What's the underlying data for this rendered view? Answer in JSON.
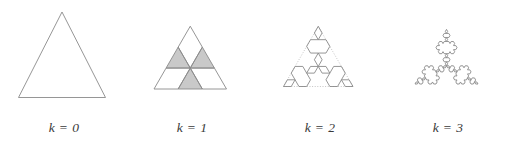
{
  "figure": {
    "type": "koch-snowflake-iterations",
    "background_color": "#ffffff",
    "stroke_color": "#8a8a8a",
    "guide_color": "#b6b6b6",
    "shade_color": "#c9c9c9",
    "panel_count": 4
  },
  "panels": [
    {
      "id": "k0",
      "caption": "k = 0",
      "iteration": 0,
      "segments": 3,
      "description": "equilateral triangle",
      "has_guide": false,
      "shaded_triangles": 0
    },
    {
      "id": "k1",
      "caption": "k = 1",
      "iteration": 1,
      "segments": 12,
      "description": "six-pointed star",
      "has_guide": false,
      "shaded_triangles": 3
    },
    {
      "id": "k2",
      "caption": "k = 2",
      "iteration": 2,
      "segments": 48,
      "description": "koch snowflake level 2",
      "has_guide": true,
      "shaded_triangles": 0
    },
    {
      "id": "k3",
      "caption": "k = 3",
      "iteration": 3,
      "segments": 192,
      "description": "koch snowflake level 3",
      "has_guide": false,
      "shaded_triangles": 0
    }
  ],
  "chart_data": {
    "type": "diagram",
    "title": "",
    "categories": [
      "k = 0",
      "k = 1",
      "k = 2",
      "k = 3"
    ],
    "values": [
      3,
      12,
      48,
      192
    ],
    "xlabel": "",
    "ylabel": "",
    "legend": []
  }
}
